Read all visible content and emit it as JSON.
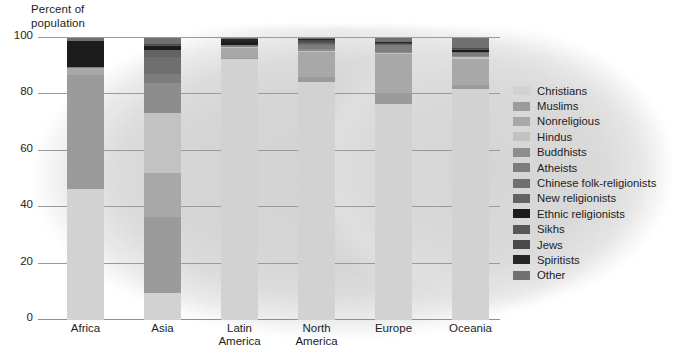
{
  "chart_data": {
    "type": "bar",
    "subtype": "stacked-bar",
    "title": "",
    "xlabel": "",
    "ylabel": "Percent of\npopulation",
    "ylim": [
      0,
      100
    ],
    "yticks": [
      0,
      20,
      40,
      60,
      80,
      100
    ],
    "grid": true,
    "legend_position": "right",
    "categories": [
      "Africa",
      "Asia",
      "Latin\nAmerica",
      "North\nAmerica",
      "Europe",
      "Oceania"
    ],
    "series": [
      {
        "name": "Christians",
        "color": "#d2d2d2",
        "values": [
          46.5,
          9.5,
          92.5,
          84.5,
          76.5,
          82.0
        ]
      },
      {
        "name": "Muslims",
        "color": "#9b9b9b",
        "values": [
          40.5,
          27.0,
          0.5,
          1.8,
          4.0,
          1.3
        ]
      },
      {
        "name": "Nonreligious",
        "color": "#a8a8a8",
        "values": [
          2.2,
          15.5,
          3.6,
          8.7,
          14.0,
          9.4
        ]
      },
      {
        "name": "Hindus",
        "color": "#c2c2c2",
        "values": [
          0.3,
          21.5,
          0.1,
          0.4,
          0.2,
          0.4
        ]
      },
      {
        "name": "Buddhists",
        "color": "#8d8d8d",
        "values": [
          0.0,
          10.5,
          0.1,
          0.6,
          0.3,
          0.4
        ]
      },
      {
        "name": "Atheists",
        "color": "#7d7d7d",
        "values": [
          0.4,
          3.4,
          0.6,
          1.6,
          2.5,
          1.2
        ]
      },
      {
        "name": "Chinese folk-religionists",
        "color": "#6f6f6f",
        "values": [
          0.0,
          5.9,
          0.0,
          0.2,
          0.1,
          0.2
        ]
      },
      {
        "name": "New religionists",
        "color": "#636363",
        "values": [
          0.0,
          2.4,
          0.1,
          0.3,
          0.2,
          0.2
        ]
      },
      {
        "name": "Ethnic religionists",
        "color": "#1c1c1c",
        "values": [
          9.0,
          1.4,
          1.0,
          0.2,
          0.1,
          0.8
        ]
      },
      {
        "name": "Sikhs",
        "color": "#585858",
        "values": [
          0.1,
          0.6,
          0.0,
          0.2,
          0.1,
          0.1
        ]
      },
      {
        "name": "Jews",
        "color": "#4a4a4a",
        "values": [
          0.1,
          0.1,
          0.2,
          0.7,
          0.4,
          0.3
        ]
      },
      {
        "name": "Spiritists",
        "color": "#262626",
        "values": [
          0.0,
          0.0,
          1.0,
          0.4,
          0.1,
          0.1
        ]
      },
      {
        "name": "Other",
        "color": "#707070",
        "values": [
          0.9,
          2.2,
          0.3,
          0.4,
          1.5,
          3.6
        ]
      }
    ]
  },
  "legend": {
    "items": [
      {
        "label": "Christians",
        "color": "#d2d2d2"
      },
      {
        "label": "Muslims",
        "color": "#9b9b9b"
      },
      {
        "label": "Nonreligious",
        "color": "#a8a8a8"
      },
      {
        "label": "Hindus",
        "color": "#c2c2c2"
      },
      {
        "label": "Buddhists",
        "color": "#8d8d8d"
      },
      {
        "label": "Atheists",
        "color": "#7d7d7d"
      },
      {
        "label": "Chinese folk-religionists",
        "color": "#6f6f6f"
      },
      {
        "label": "New religionists",
        "color": "#636363"
      },
      {
        "label": "Ethnic religionists",
        "color": "#1c1c1c"
      },
      {
        "label": "Sikhs",
        "color": "#585858"
      },
      {
        "label": "Jews",
        "color": "#4a4a4a"
      },
      {
        "label": "Spiritists",
        "color": "#262626"
      },
      {
        "label": "Other",
        "color": "#707070"
      }
    ]
  },
  "colors": {
    "gridline": "#9a9a9a",
    "axis": "#8e8e8e",
    "text": "#1d1d1d",
    "halo": "#d6d6d6",
    "background": "#ffffff"
  }
}
